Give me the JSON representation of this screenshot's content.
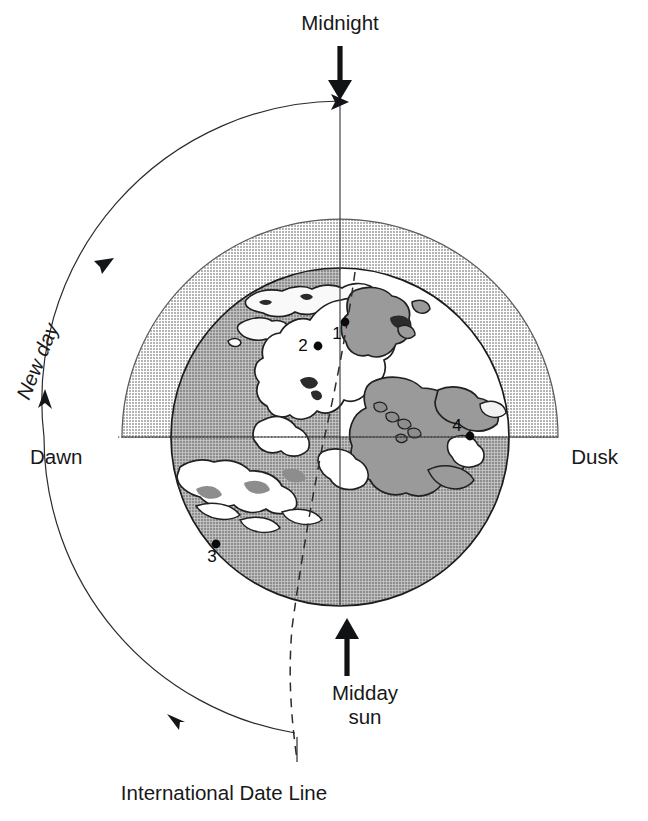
{
  "figure": {
    "title_alt": "Earth rotation diagram showing day and night, dawn and dusk",
    "labels": {
      "midnight": "Midnight",
      "dawn": "Dawn",
      "dusk": "Dusk",
      "new_day": "New day",
      "midday_line1": "Midday",
      "midday_line2": "sun",
      "date_line": "International Date Line"
    },
    "markers": [
      {
        "id": "1",
        "label": "1",
        "x": 345,
        "y": 322,
        "label_dx": -8,
        "label_dy": 17
      },
      {
        "id": "2",
        "label": "2",
        "x": 318,
        "y": 346,
        "label_dx": -15,
        "label_dy": 5
      },
      {
        "id": "3",
        "label": "3",
        "x": 216,
        "y": 544,
        "label_dx": -4,
        "label_dy": 18
      },
      {
        "id": "4",
        "label": "4",
        "x": 470,
        "y": 436,
        "label_dx": -13,
        "label_dy": -5
      }
    ],
    "colors": {
      "night_band": "#bfbfbf",
      "night_ocean": "#9a9a9a",
      "land_day": "#9a9a9a",
      "day_ocean": "#ffffff",
      "land_night": "#f7f7f7",
      "outline": "#1b1c1e",
      "text": "#17181a"
    },
    "geometry": {
      "globe_center_x": 340,
      "globe_center_y": 437,
      "globe_radius": 169,
      "band_radius": 218,
      "rotation_arc_radius": 300
    }
  }
}
